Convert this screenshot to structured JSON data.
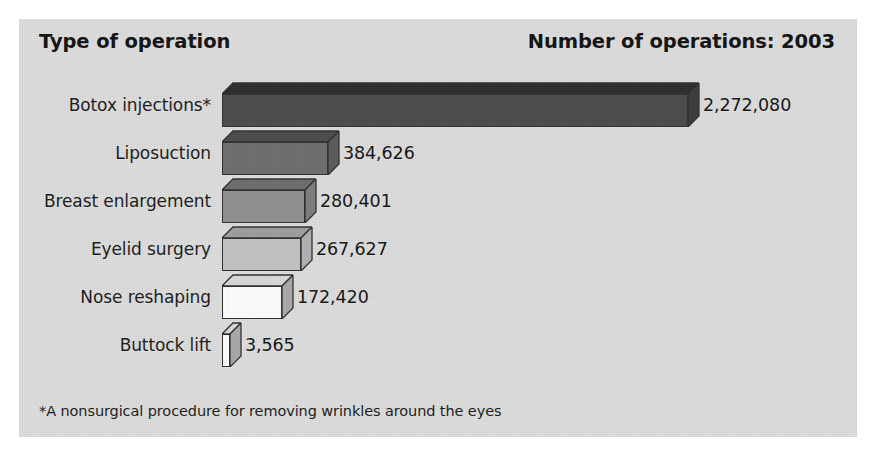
{
  "header": {
    "left_title": "Type of operation",
    "right_title": "Number of operations: 2003"
  },
  "footnote": "*A nonsurgical procedure for removing wrinkles around the eyes",
  "colors": {
    "panel_background": "#dcdcdc",
    "page_background": "#ffffff",
    "outline": "#2f2f2f",
    "text": "#111111"
  },
  "chart_data": {
    "type": "bar",
    "orientation": "horizontal",
    "title": "Number of operations: 2003",
    "xlabel": "Number of operations",
    "ylabel": "Type of operation",
    "grid": false,
    "legend": null,
    "xlim": [
      0,
      2272080
    ],
    "categories": [
      "Botox injections*",
      "Liposuction",
      "Breast enlargement",
      "Eyelid surgery",
      "Nose reshaping",
      "Buttock lift"
    ],
    "values": [
      2272080,
      384626,
      280401,
      267627,
      172420,
      3565
    ],
    "value_labels": [
      "2,272,080",
      "384,626",
      "280,401",
      "267,627",
      "172,420",
      "3,565"
    ],
    "bar_front_colors": [
      "#4a4a4a",
      "#6d6d6d",
      "#8f8f8f",
      "#c2c2c2",
      "#fdfdfd",
      "#fdfdfd"
    ],
    "bar_top_colors": [
      "#2b2b2b",
      "#4a4a4a",
      "#6d6d6d",
      "#9d9d9d",
      "#d8d8d8",
      "#d8d8d8"
    ],
    "bar_side_colors": [
      "#3a3a3a",
      "#5a5a5a",
      "#7d7d7d",
      "#b0b0b0",
      "#a8a8a8",
      "#a8a8a8"
    ],
    "bar_pixel_widths": [
      466,
      106,
      83,
      79,
      60,
      8
    ],
    "annotations": [
      "*A nonsurgical procedure for removing wrinkles around the eyes"
    ]
  }
}
